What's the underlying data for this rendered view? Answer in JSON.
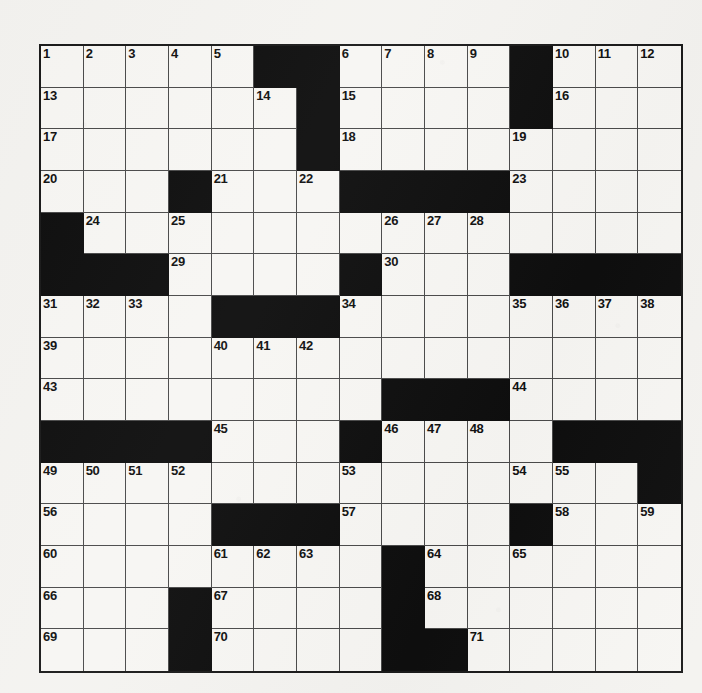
{
  "puzzle": {
    "type": "crossword-grid",
    "title": "Crossword Puzzle Grid",
    "rows": 15,
    "columns": 15,
    "highest_clue_number": 71,
    "colors": {
      "paper": "#f4f3f0",
      "cell_fill": "#f7f6f3",
      "block_fill": "#0e0e0e",
      "grid_line": "#4a4a4a",
      "border": "#1a1a1a",
      "number_text": "#111111"
    },
    "legend": {
      "block_symbol": "#",
      "open_symbol": "."
    },
    "grid": [
      ".....##....#...",
      "......#....#...",
      "......#........",
      "...#...####....",
      "#..............",
      "###....#...####",
      "....###........",
      "...............",
      "........###....",
      "####...#....###",
      "..............#",
      "....###....#...",
      "........#......",
      "...#....#......",
      "...#....##....."
    ],
    "numbers": [
      [
        1,
        2,
        3,
        4,
        5,
        0,
        0,
        6,
        7,
        8,
        9,
        0,
        10,
        11,
        12
      ],
      [
        13,
        0,
        0,
        0,
        0,
        14,
        0,
        15,
        0,
        0,
        0,
        0,
        16,
        0,
        0
      ],
      [
        17,
        0,
        0,
        0,
        0,
        0,
        0,
        18,
        0,
        0,
        0,
        19,
        0,
        0,
        0
      ],
      [
        20,
        0,
        0,
        0,
        21,
        0,
        22,
        0,
        0,
        0,
        0,
        23,
        0,
        0,
        0
      ],
      [
        0,
        24,
        0,
        25,
        0,
        0,
        0,
        0,
        26,
        27,
        28,
        0,
        0,
        0,
        0
      ],
      [
        0,
        0,
        0,
        29,
        0,
        0,
        0,
        0,
        30,
        0,
        0,
        0,
        0,
        0,
        0
      ],
      [
        31,
        32,
        33,
        0,
        0,
        0,
        0,
        34,
        0,
        0,
        0,
        35,
        36,
        37,
        38
      ],
      [
        39,
        0,
        0,
        0,
        40,
        41,
        42,
        0,
        0,
        0,
        0,
        0,
        0,
        0,
        0
      ],
      [
        43,
        0,
        0,
        0,
        0,
        0,
        0,
        0,
        0,
        0,
        0,
        44,
        0,
        0,
        0
      ],
      [
        0,
        0,
        0,
        0,
        45,
        0,
        0,
        0,
        46,
        47,
        48,
        0,
        0,
        0,
        0
      ],
      [
        49,
        50,
        51,
        52,
        0,
        0,
        0,
        53,
        0,
        0,
        0,
        54,
        55,
        0,
        0
      ],
      [
        56,
        0,
        0,
        0,
        0,
        0,
        0,
        57,
        0,
        0,
        0,
        0,
        58,
        0,
        59
      ],
      [
        60,
        0,
        0,
        0,
        61,
        62,
        63,
        0,
        0,
        64,
        0,
        65,
        0,
        0,
        0
      ],
      [
        66,
        0,
        0,
        0,
        67,
        0,
        0,
        0,
        0,
        68,
        0,
        0,
        0,
        0,
        0
      ],
      [
        69,
        0,
        0,
        0,
        70,
        0,
        0,
        0,
        0,
        0,
        71,
        0,
        0,
        0,
        0
      ]
    ],
    "letters": [
      [
        "",
        "",
        "",
        "",
        "",
        "",
        "",
        "",
        "",
        "",
        "",
        "",
        "",
        "",
        ""
      ],
      [
        "",
        "",
        "",
        "",
        "",
        "",
        "",
        "",
        "",
        "",
        "",
        "",
        "",
        "",
        ""
      ],
      [
        "",
        "",
        "",
        "",
        "",
        "",
        "",
        "",
        "",
        "",
        "",
        "",
        "",
        "",
        ""
      ],
      [
        "",
        "",
        "",
        "",
        "",
        "",
        "",
        "",
        "",
        "",
        "",
        "",
        "",
        "",
        ""
      ],
      [
        "",
        "",
        "",
        "",
        "",
        "",
        "",
        "",
        "",
        "",
        "",
        "",
        "",
        "",
        ""
      ],
      [
        "",
        "",
        "",
        "",
        "",
        "",
        "",
        "",
        "",
        "",
        "",
        "",
        "",
        "",
        ""
      ],
      [
        "",
        "",
        "",
        "",
        "",
        "",
        "",
        "",
        "",
        "",
        "",
        "",
        "",
        "",
        ""
      ],
      [
        "",
        "",
        "",
        "",
        "",
        "",
        "",
        "",
        "",
        "",
        "",
        "",
        "",
        "",
        ""
      ],
      [
        "",
        "",
        "",
        "",
        "",
        "",
        "",
        "",
        "",
        "",
        "",
        "",
        "",
        "",
        ""
      ],
      [
        "",
        "",
        "",
        "",
        "",
        "",
        "",
        "",
        "",
        "",
        "",
        "",
        "",
        "",
        ""
      ],
      [
        "",
        "",
        "",
        "",
        "",
        "",
        "",
        "",
        "",
        "",
        "",
        "",
        "",
        "",
        ""
      ],
      [
        "",
        "",
        "",
        "",
        "",
        "",
        "",
        "",
        "",
        "",
        "",
        "",
        "",
        "",
        ""
      ],
      [
        "",
        "",
        "",
        "",
        "",
        "",
        "",
        "",
        "",
        "",
        "",
        "",
        "",
        "",
        ""
      ],
      [
        "",
        "",
        "",
        "",
        "",
        "",
        "",
        "",
        "",
        "",
        "",
        "",
        "",
        "",
        ""
      ],
      [
        "",
        "",
        "",
        "",
        "",
        "",
        "",
        "",
        "",
        "",
        "",
        "",
        "",
        "",
        ""
      ]
    ]
  }
}
